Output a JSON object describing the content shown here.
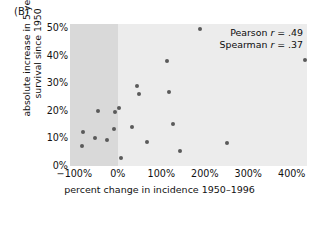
{
  "panel": {
    "label": "(B)"
  },
  "annotation": {
    "pearson_prefix": "Pearson ",
    "pearson_symbol": "r",
    "pearson_value": " = .49",
    "spearman_prefix": "Spearman ",
    "spearman_symbol": "r",
    "spearman_value": " = .37"
  },
  "axes": {
    "y_title_line1": "absolute increase in 5-year",
    "y_title_line2": "survival since 1950",
    "x_title": "percent change in incidence 1950–1996"
  },
  "colors": {
    "plot_background": "#ececec",
    "shaded_band": "#d9d9d9",
    "point": "#5a5a5a",
    "text": "#111111",
    "page_background": "#ffffff"
  },
  "chart_data": {
    "type": "scatter",
    "title": "",
    "xlabel": "percent change in incidence 1950–1996",
    "ylabel": "absolute increase in 5-year survival since 1950",
    "xlim": [
      -110,
      435
    ],
    "ylim": [
      0,
      51.5
    ],
    "xticks": [
      -100,
      0,
      100,
      200,
      300,
      400
    ],
    "xticklabels": [
      "−100%",
      "0%",
      "100%",
      "200%",
      "300%",
      "400%"
    ],
    "yticks": [
      0,
      10,
      20,
      30,
      40,
      50
    ],
    "yticklabels": [
      "0%",
      "10%",
      "20%",
      "30%",
      "40%",
      "50%"
    ],
    "grid": false,
    "legend": false,
    "shaded_region": {
      "x_from": -110,
      "x_to": 0,
      "label": "decreasing incidence"
    },
    "annotations": [
      {
        "text": "Pearson r = .49",
        "position": "top-right"
      },
      {
        "text": "Spearman r = .37",
        "position": "top-right"
      }
    ],
    "series": [
      {
        "name": "cancer sites",
        "points": [
          {
            "x": -80,
            "y": 12.3
          },
          {
            "x": -82,
            "y": 7.3
          },
          {
            "x": -52,
            "y": 10.0
          },
          {
            "x": -45,
            "y": 19.9
          },
          {
            "x": -24,
            "y": 9.5
          },
          {
            "x": -8,
            "y": 13.5
          },
          {
            "x": -6,
            "y": 19.6
          },
          {
            "x": 2,
            "y": 21.2
          },
          {
            "x": 7,
            "y": 3.0
          },
          {
            "x": 33,
            "y": 14.1
          },
          {
            "x": 45,
            "y": 28.9
          },
          {
            "x": 48,
            "y": 26.1
          },
          {
            "x": 68,
            "y": 8.6
          },
          {
            "x": 112,
            "y": 38.2
          },
          {
            "x": 118,
            "y": 26.8
          },
          {
            "x": 128,
            "y": 15.2
          },
          {
            "x": 142,
            "y": 5.3
          },
          {
            "x": 190,
            "y": 49.8
          },
          {
            "x": 250,
            "y": 8.2
          },
          {
            "x": 430,
            "y": 38.3
          }
        ]
      }
    ]
  }
}
